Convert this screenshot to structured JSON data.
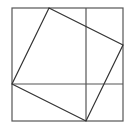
{
  "diagram": {
    "type": "pythagorean-proof",
    "stroke_color": "#555555",
    "background": "#ffffff",
    "outer_square": {
      "x": 12,
      "y": 8,
      "width": 111,
      "height": 113
    },
    "inner_square_points": "49,8 123,45 86,121 12,84",
    "vertical_line": {
      "x1": 86,
      "y1": 8,
      "x2": 86,
      "y2": 121
    },
    "horizontal_line": {
      "x1": 12,
      "y1": 84,
      "x2": 123,
      "y2": 84
    }
  }
}
